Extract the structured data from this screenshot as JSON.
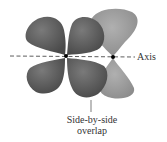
{
  "diagram": {
    "labels": {
      "axis": "Axis",
      "overlap_line1": "Side-by-side",
      "overlap_line2": "overlap"
    },
    "colors": {
      "d_orbital": "#5a5a5a",
      "p_orbital": "#9a9a9a",
      "axis_line": "#333333",
      "nucleus": "#000000",
      "text": "#333333"
    },
    "nuclei": [
      {
        "name": "d-orbital-center",
        "x": 66,
        "y": 56
      },
      {
        "name": "p-orbital-center",
        "x": 113,
        "y": 57
      }
    ]
  }
}
